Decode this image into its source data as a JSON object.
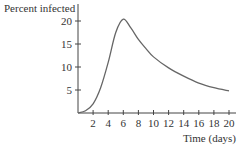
{
  "chart_data": {
    "type": "line",
    "title": "",
    "xlabel": "Time (days)",
    "ylabel": "Percent infected",
    "xlim": [
      0,
      20
    ],
    "ylim": [
      0,
      22
    ],
    "x_ticks": [
      2,
      4,
      6,
      8,
      10,
      12,
      14,
      16,
      18,
      20
    ],
    "y_ticks": [
      5,
      10,
      15,
      20
    ],
    "grid": false,
    "legend": null,
    "series": [
      {
        "name": "Percent infected",
        "x": [
          0,
          1,
          2,
          3,
          4,
          5,
          6,
          7,
          8,
          9,
          10,
          12,
          14,
          16,
          18,
          20
        ],
        "values": [
          0,
          0.5,
          2,
          5.5,
          11,
          17.5,
          20.4,
          18.5,
          16,
          14,
          12.2,
          9.8,
          8,
          6.5,
          5.5,
          4.8
        ]
      }
    ],
    "colors": {
      "line": "#666666",
      "axis": "#444444"
    }
  },
  "labels": {
    "ylabel": "Percent infected",
    "xlabel": "Time (days)"
  }
}
